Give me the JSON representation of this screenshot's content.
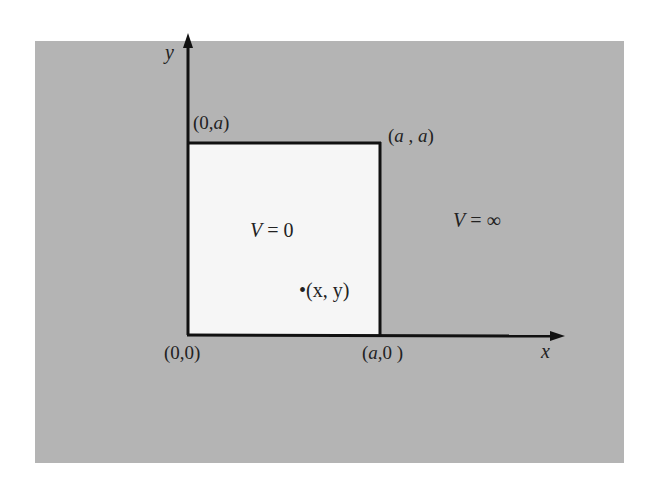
{
  "diagram": {
    "title": "",
    "colors": {
      "background_outer": "#ffffff",
      "region_outside": "#b4b4b4",
      "region_inside": "#f6f6f6",
      "lines": "#111111",
      "text": "#222222"
    },
    "axes": {
      "x_label": "x",
      "y_label": "y"
    },
    "corners": {
      "origin": {
        "open": "(",
        "a": "0",
        "comma": ",",
        "b": "0",
        "close": ")"
      },
      "top_left": {
        "open": "(",
        "a": "0",
        "comma": ",",
        "b": "a",
        "close": ")"
      },
      "top_right": {
        "open": "(",
        "a": "a",
        "comma": " , ",
        "b": "a",
        "close": ")"
      },
      "bottom_right": {
        "open": "(",
        "a": "a",
        "comma": ",",
        "b": "0",
        "close": " )"
      }
    },
    "regions": {
      "inside": {
        "var": "V",
        "eq": " = ",
        "value": "0"
      },
      "outside": {
        "var": "V",
        "eq": " = ",
        "value": "∞"
      }
    },
    "point": {
      "bullet": "•",
      "label": "(x, y)"
    }
  }
}
